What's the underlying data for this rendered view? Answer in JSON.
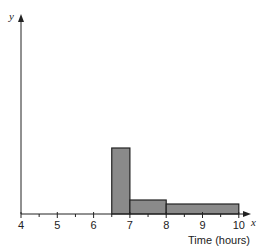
{
  "chart_data": {
    "type": "bar",
    "subtype": "histogram",
    "title": "",
    "xlabel": "Time (hours)",
    "ylabel": "",
    "x_axis_variable": "x",
    "y_axis_variable": "y",
    "xlim": [
      4,
      10
    ],
    "x_ticks": [
      4,
      5,
      6,
      7,
      8,
      9,
      10
    ],
    "x_tick_labels": [
      "4",
      "5",
      "6",
      "7",
      "8",
      "9",
      "10"
    ],
    "x_minor_ticks": [
      4.5,
      5.5,
      6.5,
      7.5,
      8.5,
      9.5
    ],
    "y_scale_shown": false,
    "grid": false,
    "legend": null,
    "bins": [
      {
        "from": 6.5,
        "to": 7,
        "relative_height": 66
      },
      {
        "from": 7,
        "to": 8,
        "relative_height": 14
      },
      {
        "from": 8,
        "to": 10,
        "relative_height": 10
      }
    ],
    "bar_color": "#8a8a8a",
    "edge_color": "#222222"
  }
}
